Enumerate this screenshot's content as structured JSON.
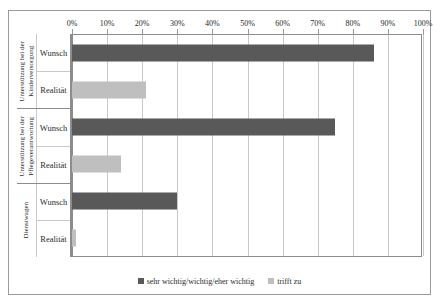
{
  "chart_data": {
    "type": "bar",
    "orientation": "horizontal",
    "title": "",
    "xlabel": "",
    "ylabel": "",
    "xlim": [
      0,
      100
    ],
    "xtick_labels": [
      "0%",
      "10%",
      "20%",
      "30%",
      "40%",
      "50%",
      "60%",
      "70%",
      "80%",
      "90%",
      "100%"
    ],
    "xtick_values": [
      0,
      10,
      20,
      30,
      40,
      50,
      60,
      70,
      80,
      90,
      100
    ],
    "grid": true,
    "legend_position": "bottom",
    "legend": [
      {
        "name": "sehr wichtig/wichtig/eher wichtig",
        "color": "#595959"
      },
      {
        "name": "trifft zu",
        "color": "#bfbfbf"
      }
    ],
    "groups": [
      {
        "name": "Unterstützung bei der\nKinderversorgung",
        "bars": [
          {
            "label": "Wunsch",
            "value": 86,
            "series": "sehr wichtig/wichtig/eher wichtig",
            "color": "#595959"
          },
          {
            "label": "Realität",
            "value": 21,
            "series": "trifft zu",
            "color": "#bfbfbf"
          }
        ]
      },
      {
        "name": "Unterstützung bei der\nPflegeverantwortung",
        "bars": [
          {
            "label": "Wunsch",
            "value": 75,
            "series": "sehr wichtig/wichtig/eher wichtig",
            "color": "#595959"
          },
          {
            "label": "Realität",
            "value": 14,
            "series": "trifft zu",
            "color": "#bfbfbf"
          }
        ]
      },
      {
        "name": "Dienstwagen",
        "bars": [
          {
            "label": "Wunsch",
            "value": 30,
            "series": "sehr wichtig/wichtig/eher wichtig",
            "color": "#595959"
          },
          {
            "label": "Realität",
            "value": 1,
            "series": "trifft zu",
            "color": "#bfbfbf"
          }
        ]
      }
    ]
  },
  "colors": {
    "series_dark": "#595959",
    "series_light": "#bfbfbf",
    "gridline": "#c9c9c9",
    "axis": "#8c8c8c",
    "frame": "#9a9a9a",
    "background": "#ffffff"
  }
}
